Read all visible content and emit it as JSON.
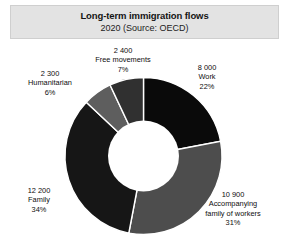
{
  "chart_data": {
    "type": "pie",
    "variant": "donut",
    "title": "Long-term immigration flows",
    "subtitle": "2020 (Source: OECD)",
    "xlabel": "",
    "ylabel": "",
    "legend": "none",
    "grid": false,
    "data_labels_position": "outside",
    "total": 35800,
    "categories": [
      "Work",
      "Accompanying family of workers",
      "Family",
      "Humanitarian",
      "Free movements"
    ],
    "values": [
      8000,
      10900,
      12200,
      2300,
      2400
    ],
    "percentages": [
      22,
      31,
      34,
      6,
      7
    ],
    "colors": [
      "#0a0a0a",
      "#4d4d4d",
      "#161616",
      "#5e5e5e",
      "#303030"
    ],
    "slices": [
      {
        "name": "work",
        "value_text": "8 000",
        "label_text": "Work",
        "percent_text": "22%",
        "value": 8000,
        "percent": 22,
        "color": "#0a0a0a"
      },
      {
        "name": "accompanying-family-of-workers",
        "value_text": "10 900",
        "label_text": "Accompanying",
        "label_text_2": "family of workers",
        "percent_text": "31%",
        "value": 10900,
        "percent": 31,
        "color": "#4d4d4d"
      },
      {
        "name": "family",
        "value_text": "12 200",
        "label_text": "Family",
        "percent_text": "34%",
        "value": 12200,
        "percent": 34,
        "color": "#161616"
      },
      {
        "name": "humanitarian",
        "value_text": "2 300",
        "label_text": "Humanitarian",
        "percent_text": "6%",
        "value": 2300,
        "percent": 6,
        "color": "#5e5e5e"
      },
      {
        "name": "free-movements",
        "value_text": "2 400",
        "label_text": "Free movements",
        "percent_text": "7%",
        "value": 2400,
        "percent": 7,
        "color": "#303030"
      }
    ]
  }
}
